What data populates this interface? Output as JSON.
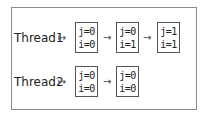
{
  "diagram": {
    "threads": [
      {
        "label": "Thread1",
        "start_arrow": "↦",
        "states": [
          {
            "j": "j=0",
            "i": "i=0"
          },
          {
            "j": "j=0",
            "i": "i=1"
          },
          {
            "j": "j=1",
            "i": "i=1"
          }
        ]
      },
      {
        "label": "Thread2",
        "start_arrow": "↦",
        "states": [
          {
            "j": "j=0",
            "i": "i=0"
          },
          {
            "j": "j=0",
            "i": "i=0"
          }
        ]
      }
    ],
    "transition_arrow": "→"
  }
}
